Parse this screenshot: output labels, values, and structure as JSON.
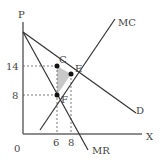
{
  "diagram": {
    "axes": {
      "y_label": "P",
      "x_label": "X",
      "origin_label": "0",
      "y_ticks": [
        "14",
        "8"
      ],
      "x_ticks": [
        "6",
        "8"
      ]
    },
    "curves": {
      "mc": "MC",
      "demand": "D",
      "mr": "MR"
    },
    "points": {
      "c": "C",
      "e": "E",
      "f": "F"
    },
    "colors": {
      "line": "#333333",
      "axis": "#555555",
      "shade": "#c8c8c8"
    }
  }
}
